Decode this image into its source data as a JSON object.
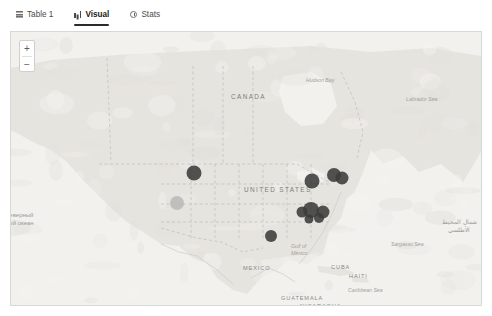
{
  "tabs": [
    {
      "label": "Table 1",
      "icon": "table-icon",
      "active": false
    },
    {
      "label": "Visual",
      "icon": "bar-chart-icon",
      "active": true
    },
    {
      "label": "Stats",
      "icon": "clock-icon",
      "active": false
    }
  ],
  "map": {
    "zoom_in_label": "+",
    "zoom_out_label": "−",
    "background_color": "#eceae6",
    "land_color": "#e6e4df",
    "water_color": "#f2f1ee",
    "border_color": "#d8d8d8",
    "marker_color": "#3b3b3b",
    "marker_color_light": "#b8b8b8",
    "labels": [
      {
        "name": "canada",
        "text": "CANADA",
        "x": 230,
        "y": 93,
        "style": "country-lg"
      },
      {
        "name": "united-states",
        "text": "UNITED STATES",
        "x": 243,
        "y": 186,
        "style": "country-lg"
      },
      {
        "name": "mexico",
        "text": "MEXICO",
        "x": 242,
        "y": 265,
        "style": "country"
      },
      {
        "name": "cuba",
        "text": "CUBA",
        "x": 330,
        "y": 264,
        "style": "country"
      },
      {
        "name": "haiti",
        "text": "HAITI",
        "x": 348,
        "y": 273,
        "style": "country"
      },
      {
        "name": "guatemala",
        "text": "GUATEMALA",
        "x": 280,
        "y": 295,
        "style": "country"
      },
      {
        "name": "nicaragua",
        "text": "NICARAGUA",
        "x": 299,
        "y": 303,
        "style": "country"
      },
      {
        "name": "hudson-bay",
        "text": "Hudson Bay",
        "x": 305,
        "y": 77,
        "style": "water"
      },
      {
        "name": "labrador-sea",
        "text": "Labrador Sea",
        "x": 405,
        "y": 96,
        "style": "water"
      },
      {
        "name": "gulf-of-mexico",
        "text": "Gulf of",
        "x": 290,
        "y": 243,
        "style": "water"
      },
      {
        "name": "gulf-of-mexico-2",
        "text": "México",
        "x": 290,
        "y": 250,
        "style": "water"
      },
      {
        "name": "sargasso-sea",
        "text": "Sargasso Sea",
        "x": 390,
        "y": 241,
        "style": "water"
      },
      {
        "name": "caribbean-sea",
        "text": "Caribbean Sea",
        "x": 347,
        "y": 287,
        "style": "water"
      }
    ],
    "labels_intl": [
      {
        "name": "arctic-ocean-ru",
        "line1": "Северный",
        "line2": "ный океан",
        "x": 4,
        "y": 211
      }
    ],
    "labels_ar": [
      {
        "name": "atlantic-ocean-ar",
        "line1": "شمال المحيط",
        "line2": "الأطلسي",
        "x": 441,
        "y": 218
      }
    ],
    "markers": [
      {
        "name": "marker-montana",
        "x": 193,
        "y": 173,
        "r": 7.5,
        "tone": "dark"
      },
      {
        "name": "marker-california",
        "x": 176,
        "y": 203,
        "r": 7.0,
        "tone": "light"
      },
      {
        "name": "marker-texas",
        "x": 270,
        "y": 236,
        "r": 6.0,
        "tone": "dark"
      },
      {
        "name": "marker-great-lakes",
        "x": 311,
        "y": 181,
        "r": 7.5,
        "tone": "dark"
      },
      {
        "name": "marker-new-england",
        "x": 333,
        "y": 175,
        "r": 7.0,
        "tone": "dark"
      },
      {
        "name": "marker-northeast",
        "x": 341,
        "y": 178,
        "r": 6.5,
        "tone": "dark"
      },
      {
        "name": "marker-midatlantic",
        "x": 310,
        "y": 210,
        "r": 8.0,
        "tone": "dark"
      },
      {
        "name": "marker-virginia",
        "x": 322,
        "y": 212,
        "r": 6.5,
        "tone": "dark"
      },
      {
        "name": "marker-carolina",
        "x": 301,
        "y": 212,
        "r": 5.5,
        "tone": "dark"
      },
      {
        "name": "marker-georgia",
        "x": 318,
        "y": 218,
        "r": 5.0,
        "tone": "dark"
      },
      {
        "name": "marker-tennessee",
        "x": 308,
        "y": 219,
        "r": 4.5,
        "tone": "dark"
      }
    ]
  }
}
